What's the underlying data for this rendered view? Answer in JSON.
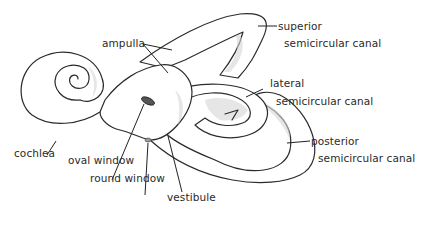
{
  "diagram": {
    "colors": {
      "background": "#ffffff",
      "line": "#2b2b2b",
      "shading": "#d6d6d6",
      "text": "#2a2a2a"
    },
    "labels": {
      "ampulla": "ampulla",
      "superior_line1": "superior",
      "superior_line2": "semicircular canal",
      "lateral_line1": "lateral",
      "lateral_line2": "semicircular canal",
      "posterior_line1": "posterior",
      "posterior_line2": "semicircular canal",
      "cochlea": "cochlea",
      "oval_window": "oval window",
      "round_window": "round window",
      "vestibule": "vestibule"
    }
  }
}
